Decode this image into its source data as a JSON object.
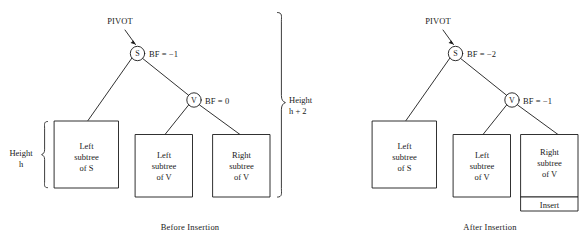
{
  "figure": {
    "type": "avl-tree-rebalance-diagram"
  },
  "panels": [
    {
      "id": "before",
      "caption": "Before Insertion",
      "pivot_label": "PIVOT",
      "nodes": [
        {
          "id": "s",
          "letter": "S",
          "bf_label": "BF = −1"
        },
        {
          "id": "v",
          "letter": "V",
          "bf_label": "BF = 0"
        }
      ],
      "boxes": [
        {
          "id": "left-subtree-of-s",
          "line1": "Left",
          "line2": "subtree",
          "line3": "of S"
        },
        {
          "id": "left-subtree-of-v",
          "line1": "Left",
          "line2": "subtree",
          "line3": "of V"
        },
        {
          "id": "right-subtree-of-v",
          "line1": "Right",
          "line2": "subtree",
          "line3": "of V"
        }
      ],
      "braces": [
        {
          "id": "height-h",
          "line1": "Height",
          "line2": "h"
        },
        {
          "id": "height-h-plus-2",
          "line1": "Height",
          "line2": "h + 2"
        }
      ]
    },
    {
      "id": "after",
      "caption": "After Insertion",
      "pivot_label": "PIVOT",
      "nodes": [
        {
          "id": "s",
          "letter": "S",
          "bf_label": "BF = −2"
        },
        {
          "id": "v",
          "letter": "V",
          "bf_label": "BF = −1"
        }
      ],
      "boxes": [
        {
          "id": "left-subtree-of-s",
          "line1": "Left",
          "line2": "subtree",
          "line3": "of S"
        },
        {
          "id": "left-subtree-of-v",
          "line1": "Left",
          "line2": "subtree",
          "line3": "of V"
        },
        {
          "id": "right-subtree-of-v",
          "line1": "Right",
          "line2": "subtree",
          "line3": "of V"
        }
      ],
      "insert_box_label": "Insert"
    }
  ],
  "colors": {
    "stroke": "#1a1a1a",
    "background": "#ffffff",
    "text": "#1a1a1a"
  }
}
